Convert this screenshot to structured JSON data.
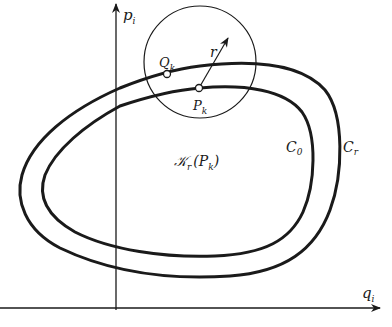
{
  "figure": {
    "type": "phase-space diagram",
    "axes": {
      "vertical_label": "p",
      "vertical_subscript": "i",
      "horizontal_label": "q",
      "horizontal_subscript": "i"
    },
    "curves": [
      {
        "name": "C",
        "subscript": "0",
        "role": "inner closed trajectory"
      },
      {
        "name": "C",
        "subscript": "r",
        "role": "outer closed trajectory"
      }
    ],
    "points": [
      {
        "name": "Q",
        "subscript": "k"
      },
      {
        "name": "P",
        "subscript": "k"
      }
    ],
    "circle": {
      "radius_label": "r",
      "neighborhood_label": "𝒦",
      "neighborhood_subscript": "r",
      "neighborhood_arg_open": "(",
      "neighborhood_arg": "P",
      "neighborhood_arg_subscript": "k",
      "neighborhood_arg_close": ")"
    },
    "colors": {
      "ink": "#1a1a1a",
      "background": "#ffffff",
      "point_fill": "#ffffff"
    }
  }
}
